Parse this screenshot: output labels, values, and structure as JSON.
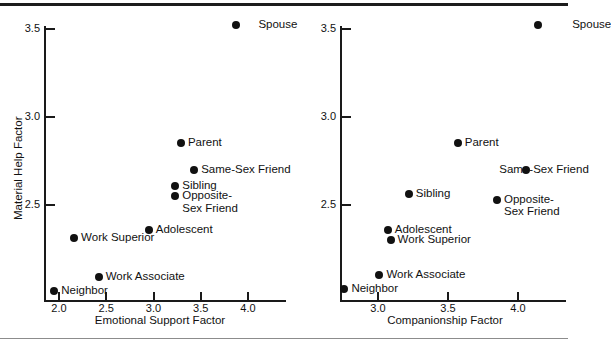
{
  "figure": {
    "background": "#ffffff",
    "marker_color": "#111111",
    "axis_color": "#1a1a1a",
    "rule_top_color": "#1c1c1c",
    "rule_bottom_color": "#8c8c8c"
  },
  "chart_data": [
    {
      "type": "scatter",
      "panel": "left",
      "title": "",
      "xlabel": "Emotional Support Factor",
      "ylabel": "Material Help Factor",
      "xlim": [
        1.88,
        4.2
      ],
      "ylim": [
        2.05,
        3.62
      ],
      "xticks": [
        2.0,
        2.5,
        3.0,
        3.5,
        4.0
      ],
      "xticklabels": [
        "2.0",
        "2.5",
        "3.0",
        "3.5",
        "4.0"
      ],
      "yticks": [
        2.5,
        3.0,
        3.5
      ],
      "yticklabels": [
        "2.5",
        "3.0",
        "3.5"
      ],
      "grid": false,
      "legend": "none",
      "points": [
        {
          "label": "Spouse",
          "x": 3.87,
          "y": 3.52,
          "label_side": "left"
        },
        {
          "label": "Parent",
          "x": 3.29,
          "y": 2.85,
          "label_side": "right"
        },
        {
          "label": "Same-Sex Friend",
          "x": 3.43,
          "y": 2.7,
          "label_side": "right"
        },
        {
          "label": "Sibling",
          "x": 3.23,
          "y": 2.61,
          "label_side": "right"
        },
        {
          "label": "Opposite-\nSex Friend",
          "x": 3.23,
          "y": 2.55,
          "label_side": "right"
        },
        {
          "label": "Adolescent",
          "x": 2.95,
          "y": 2.36,
          "label_side": "right"
        },
        {
          "label": "Work Superior",
          "x": 2.16,
          "y": 2.31,
          "label_side": "right"
        },
        {
          "label": "Work Associate",
          "x": 2.42,
          "y": 2.09,
          "label_side": "right"
        },
        {
          "label": "Neighbor",
          "x": 1.95,
          "y": 2.01,
          "label_side": "right"
        }
      ]
    },
    {
      "type": "scatter",
      "panel": "right",
      "title": "",
      "xlabel": "Companionship Factor",
      "ylabel": "",
      "xlim": [
        2.72,
        4.35
      ],
      "ylim": [
        2.05,
        3.62
      ],
      "xticks": [
        3.0,
        3.5,
        4.0
      ],
      "xticklabels": [
        "3.0",
        "3.5",
        "4.0"
      ],
      "yticks": [
        2.5,
        3.0,
        3.5
      ],
      "yticklabels": [
        "2.5",
        "3.0",
        "3.5"
      ],
      "grid": false,
      "legend": "none",
      "points": [
        {
          "label": "Spouse",
          "x": 4.14,
          "y": 3.52,
          "label_side": "left"
        },
        {
          "label": "Parent",
          "x": 3.57,
          "y": 2.85,
          "label_side": "right"
        },
        {
          "label": "Same-Sex Friend",
          "x": 4.06,
          "y": 2.7,
          "label_side": "left"
        },
        {
          "label": "Sibling",
          "x": 3.22,
          "y": 2.56,
          "label_side": "right"
        },
        {
          "label": "Opposite-\nSex Friend",
          "x": 3.85,
          "y": 2.53,
          "label_side": "right"
        },
        {
          "label": "Adolescent",
          "x": 3.07,
          "y": 2.36,
          "label_side": "right"
        },
        {
          "label": "Work Superior",
          "x": 3.09,
          "y": 2.3,
          "label_side": "right"
        },
        {
          "label": "Work Associate",
          "x": 3.01,
          "y": 2.1,
          "label_side": "right"
        },
        {
          "label": "Neighbor",
          "x": 2.76,
          "y": 2.02,
          "label_side": "right"
        }
      ]
    }
  ]
}
